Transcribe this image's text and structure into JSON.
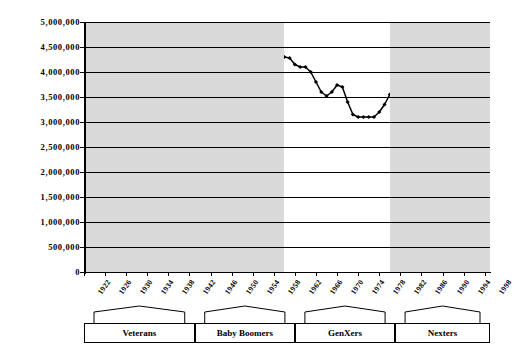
{
  "chart_data": {
    "type": "line",
    "title": "",
    "subtitle": "",
    "xlabel": "",
    "ylabel": "",
    "xlim": [
      1922,
      1999
    ],
    "ylim": [
      0,
      5000000
    ],
    "grid": true,
    "legend_position": "none",
    "y_ticks": [
      0,
      500000,
      1000000,
      1500000,
      2000000,
      2500000,
      3000000,
      3500000,
      4000000,
      4500000,
      5000000
    ],
    "y_tick_labels": [
      "0",
      "500,000",
      "1,000,000",
      "1,500,000",
      "2,000,000",
      "2,500,000",
      "3,000,000",
      "3,500,000",
      "4,000,000",
      "4,500,000",
      "5,000,000"
    ],
    "x_ticks": [
      1922,
      1926,
      1930,
      1934,
      1938,
      1942,
      1946,
      1950,
      1954,
      1958,
      1962,
      1966,
      1970,
      1974,
      1978,
      1982,
      1986,
      1990,
      1994,
      1998
    ],
    "x_tick_labels": [
      "1922",
      "1926",
      "1930",
      "1934",
      "1938",
      "1942",
      "1946",
      "1950",
      "1954",
      "1958",
      "1962",
      "1966",
      "1970",
      "1974",
      "1978",
      "1982",
      "1986",
      "1990",
      "1994",
      "1998"
    ],
    "marker": "diamond",
    "line_color": "#000000",
    "band_color": "#d9d9d9",
    "x": [
      1922,
      1923,
      1924,
      1925,
      1926,
      1927,
      1928,
      1929,
      1930,
      1931,
      1932,
      1933,
      1934,
      1935,
      1936,
      1937,
      1938,
      1939,
      1940,
      1941,
      1942,
      1943,
      1944,
      1945,
      1946,
      1947,
      1948,
      1949,
      1950,
      1951,
      1952,
      1953,
      1954,
      1955,
      1956,
      1957,
      1958,
      1959,
      1960,
      1961,
      1962,
      1963,
      1964,
      1965,
      1966,
      1967,
      1968,
      1969,
      1970,
      1971,
      1972,
      1973,
      1974,
      1975,
      1976,
      1977,
      1978,
      1979,
      1980,
      1981,
      1982,
      1983,
      1984,
      1985,
      1986,
      1987,
      1988,
      1989,
      1990,
      1991,
      1992,
      1993,
      1994,
      1995,
      1996,
      1997,
      1998,
      1999
    ],
    "y": [
      2900000,
      2850000,
      2800000,
      2750000,
      2700000,
      2650000,
      2580000,
      2510000,
      2450000,
      2400000,
      2350000,
      2310000,
      2310000,
      2310000,
      2310000,
      2320000,
      2360000,
      2370000,
      2400000,
      2450000,
      2600000,
      2700000,
      2750000,
      2800000,
      3050000,
      3100000,
      2800000,
      2950000,
      3150000,
      3300000,
      3500000,
      3820000,
      3800000,
      3810000,
      3900000,
      4050000,
      4200000,
      4250000,
      4300000,
      4280000,
      4150000,
      4100000,
      4100000,
      4000000,
      3800000,
      3600000,
      3520000,
      3600000,
      3740000,
      3700000,
      3400000,
      3150000,
      3100000,
      3100000,
      3100000,
      3100000,
      3200000,
      3350000,
      3550000,
      3600000,
      3600000,
      3650000,
      3750000,
      3750000,
      3800000,
      3850000,
      3900000,
      4000000,
      4100000,
      4120000,
      4050000,
      4000000,
      4000000,
      3950000,
      3950000,
      3950000,
      3950000,
      3950000
    ]
  },
  "bands": [
    {
      "name": "veterans-band",
      "start": 1922,
      "end": 1960,
      "shaded": true
    },
    {
      "name": "baby-boomers-band",
      "start": 1960,
      "end": 1980,
      "shaded": false
    },
    {
      "name": "genxers-band",
      "start": 1980,
      "end": 1999,
      "shaded": true
    }
  ],
  "generations": [
    {
      "label": "Veterans",
      "start": 1922,
      "end": 1943
    },
    {
      "label": "Baby Boomers",
      "start": 1943,
      "end": 1962
    },
    {
      "label": "GenXers",
      "start": 1962,
      "end": 1981
    },
    {
      "label": "Nexters",
      "start": 1981,
      "end": 1999
    }
  ]
}
